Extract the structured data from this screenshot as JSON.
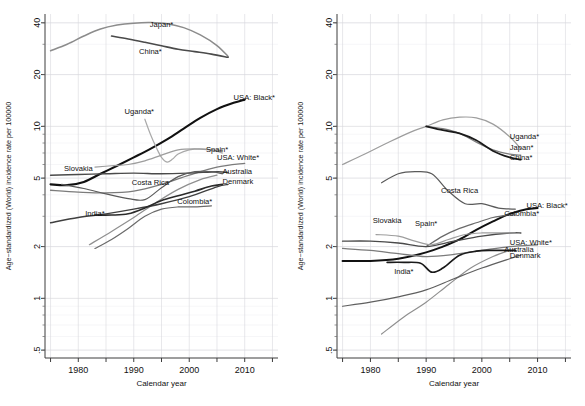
{
  "figure": {
    "title": "",
    "panel_count": 2
  },
  "axes": {
    "ylabel": "Age−standardized (World) incidence rate per 100000",
    "xlabel": "Calendar year",
    "yticks": [
      ".5",
      "1",
      "2",
      "5",
      "10",
      "20",
      "40"
    ],
    "ytick_values": [
      0.5,
      1,
      2,
      5,
      10,
      20,
      40
    ],
    "xticks": [
      "1980",
      "1990",
      "2000",
      "2010"
    ],
    "xtick_values": [
      1980,
      1990,
      2000,
      2010
    ],
    "xminor_values": [
      1975,
      1985,
      1995,
      2005,
      2015
    ],
    "xlim": [
      1974,
      2016
    ],
    "ylim": [
      0.45,
      45
    ],
    "yscale": "log",
    "grid": true
  },
  "colors": {
    "black": "#111111",
    "dark_gray": "#3f3f3f",
    "mid_gray": "#6e6e6e",
    "light_gray": "#a9a9a9",
    "pale_gray": "#c6c6c6",
    "grid": "#d9d9dd",
    "axis": "#3c3c3c"
  },
  "chart_data": [
    {
      "type": "line",
      "panel": "left",
      "title": "",
      "xlabel": "Calendar year",
      "ylabel": "Age−standardized (World) incidence rate per 100000",
      "yscale": "log",
      "xlim": [
        1974,
        2016
      ],
      "ylim": [
        0.45,
        45
      ],
      "grid": true,
      "legend": "inline-labels",
      "series": [
        {
          "name": "Japan*",
          "color": "#8c8c8c",
          "width": 1.5,
          "label_x": 1995,
          "label_y": 38.0,
          "x": [
            1975,
            1978,
            1981,
            1984,
            1987,
            1990,
            1993,
            1996,
            1999,
            2002,
            2005,
            2007
          ],
          "y": [
            27.5,
            30.0,
            33.5,
            36.8,
            38.8,
            39.8,
            40.1,
            39.5,
            37.5,
            34.0,
            29.5,
            25.5
          ]
        },
        {
          "name": "China*",
          "color": "#4a4a4a",
          "width": 1.6,
          "label_x": 1993,
          "label_y": 26.5,
          "x": [
            1986,
            1989,
            1992,
            1995,
            1998,
            2001,
            2004,
            2007
          ],
          "y": [
            33.5,
            32.2,
            30.8,
            29.4,
            28.1,
            27.2,
            26.3,
            25.2
          ]
        },
        {
          "name": "USA: Black*",
          "color": "#111111",
          "width": 2.1,
          "label_x": 2008,
          "label_y": 14.2,
          "x": [
            1975,
            1978,
            1981,
            1984,
            1987,
            1990,
            1993,
            1996,
            1999,
            2002,
            2005,
            2008,
            2010
          ],
          "y": [
            4.6,
            4.55,
            4.75,
            5.3,
            5.9,
            6.6,
            7.4,
            8.4,
            9.7,
            11.2,
            12.6,
            13.7,
            14.3
          ]
        },
        {
          "name": "Uganda*",
          "color": "#a9a9a9",
          "width": 1.2,
          "label_x": 1991,
          "label_y": 11.8,
          "x": [
            1992,
            1993,
            1994,
            1995,
            1996,
            1997,
            1998,
            2000,
            2002,
            2004,
            2006
          ],
          "y": [
            11.0,
            9.0,
            7.6,
            6.6,
            6.2,
            6.45,
            6.9,
            7.3,
            7.4,
            7.3,
            7.0
          ]
        },
        {
          "name": "Spain*",
          "color": "#9d9d9d",
          "width": 1.2,
          "label_x": 2003,
          "label_y": 7.1,
          "x": [
            1983,
            1986,
            1989,
            1992,
            1995,
            1998,
            2001,
            2004,
            2006
          ],
          "y": [
            5.8,
            5.9,
            6.0,
            6.3,
            6.8,
            7.3,
            7.4,
            7.3,
            7.2
          ]
        },
        {
          "name": "USA: White*",
          "color": "#7b7b7b",
          "width": 1.3,
          "label_x": 2005,
          "label_y": 6.4,
          "x": [
            1975,
            1980,
            1985,
            1990,
            1995,
            2000,
            2005,
            2010
          ],
          "y": [
            4.25,
            4.15,
            4.1,
            4.2,
            4.6,
            5.2,
            5.8,
            6.1
          ]
        },
        {
          "name": "Slovakia",
          "color": "#4a4a4a",
          "width": 1.4,
          "label_x": 1980,
          "label_y": 5.5,
          "x": [
            1975,
            1980,
            1985,
            1990,
            1995,
            2000,
            2005,
            2007
          ],
          "y": [
            5.2,
            5.25,
            5.3,
            5.35,
            5.3,
            5.35,
            5.45,
            5.4
          ]
        },
        {
          "name": "Costa Rica",
          "color": "#5a5a5a",
          "width": 1.2,
          "label_x": 1993,
          "label_y": 4.55,
          "x": [
            1977,
            1981,
            1985,
            1989,
            1992,
            1995,
            1998,
            2001,
            2004,
            2006
          ],
          "y": [
            4.6,
            4.35,
            4.05,
            3.8,
            3.75,
            4.4,
            5.1,
            5.45,
            5.45,
            5.3
          ]
        },
        {
          "name": "Australia",
          "color": "#8f8f8f",
          "width": 1.2,
          "label_x": 2006,
          "label_y": 5.3,
          "x": [
            1982,
            1986,
            1990,
            1994,
            1998,
            2002,
            2005
          ],
          "y": [
            2.05,
            2.45,
            2.95,
            3.6,
            4.3,
            4.9,
            5.2
          ]
        },
        {
          "name": "Denmark",
          "color": "#3f3f3f",
          "width": 1.4,
          "label_x": 2006,
          "label_y": 4.6,
          "x": [
            1975,
            1980,
            1985,
            1990,
            1995,
            2000,
            2005,
            2007
          ],
          "y": [
            2.75,
            2.95,
            3.1,
            3.3,
            3.55,
            3.9,
            4.45,
            4.6
          ]
        },
        {
          "name": "Colombia*",
          "color": "#6a6a6a",
          "width": 1.2,
          "label_x": 2001,
          "label_y": 3.55,
          "x": [
            1983,
            1986,
            1989,
            1992,
            1995,
            1998,
            2001,
            2004
          ],
          "y": [
            1.95,
            2.2,
            2.55,
            3.0,
            3.3,
            3.4,
            3.4,
            3.45
          ]
        },
        {
          "name": "India*",
          "color": "#2a2a2a",
          "width": 1.6,
          "label_x": 1983,
          "label_y": 3.0,
          "x": [
            1983,
            1986,
            1989,
            1992,
            1995,
            1998,
            2001,
            2004,
            2006
          ],
          "y": [
            3.05,
            3.05,
            3.1,
            3.35,
            3.7,
            3.95,
            4.2,
            4.5,
            4.6
          ]
        }
      ]
    },
    {
      "type": "line",
      "panel": "right",
      "title": "",
      "xlabel": "Calendar year",
      "ylabel": "Age−standardized (World) incidence rate per 100000",
      "yscale": "log",
      "xlim": [
        1974,
        2016
      ],
      "ylim": [
        0.45,
        45
      ],
      "grid": true,
      "legend": "inline-labels",
      "series": [
        {
          "name": "Uganda*",
          "color": "#9d9d9d",
          "width": 1.2,
          "label_x": 2005,
          "label_y": 8.4,
          "x": [
            1975,
            1979,
            1983,
            1987,
            1990,
            1993,
            1996,
            1999,
            2002,
            2005,
            2007
          ],
          "y": [
            6.0,
            6.9,
            8.0,
            9.2,
            10.0,
            10.9,
            11.3,
            11.2,
            10.3,
            8.7,
            7.4
          ]
        },
        {
          "name": "Japan*",
          "color": "#7d7d7d",
          "width": 1.2,
          "label_x": 2005,
          "label_y": 7.3,
          "x": [
            1990,
            1993,
            1996,
            1999,
            2002,
            2005,
            2007
          ],
          "y": [
            10.0,
            9.7,
            9.1,
            8.1,
            7.3,
            6.9,
            6.8
          ]
        },
        {
          "name": "China*",
          "color": "#1a1a1a",
          "width": 1.7,
          "label_x": 2005,
          "label_y": 6.4,
          "x": [
            1990,
            1993,
            1996,
            1999,
            2002,
            2005,
            2007
          ],
          "y": [
            10.0,
            9.5,
            9.1,
            8.3,
            7.2,
            6.6,
            6.4
          ]
        },
        {
          "name": "Costa Rica",
          "color": "#5a5a5a",
          "width": 1.2,
          "label_x": 1996,
          "label_y": 4.1,
          "x": [
            1982,
            1985,
            1988,
            1991,
            1994,
            1997,
            2000,
            2003,
            2006
          ],
          "y": [
            4.7,
            5.3,
            5.45,
            5.3,
            4.2,
            3.55,
            3.55,
            3.35,
            3.3
          ]
        },
        {
          "name": "USA: Black*",
          "color": "#111111",
          "width": 2.0,
          "label_x": 2008,
          "label_y": 3.35,
          "x": [
            1975,
            1980,
            1985,
            1990,
            1993,
            1996,
            1999,
            2002,
            2005,
            2008,
            2010
          ],
          "y": [
            1.65,
            1.65,
            1.7,
            1.85,
            2.0,
            2.2,
            2.5,
            2.8,
            3.1,
            3.3,
            3.35
          ]
        },
        {
          "name": "Colombia*",
          "color": "#6a6a6a",
          "width": 1.2,
          "label_x": 2004,
          "label_y": 3.0,
          "x": [
            1990,
            1993,
            1996,
            1999,
            2002,
            2005,
            2006
          ],
          "y": [
            2.0,
            2.3,
            2.55,
            2.75,
            2.95,
            3.05,
            3.05
          ]
        },
        {
          "name": "Slovakia",
          "color": "#4a4a4a",
          "width": 1.4,
          "label_x": 1983,
          "label_y": 2.75,
          "x": [
            1975,
            1980,
            1985,
            1990,
            1995,
            2000,
            2005,
            2007
          ],
          "y": [
            2.15,
            2.15,
            2.1,
            2.0,
            2.15,
            2.3,
            2.4,
            2.4
          ]
        },
        {
          "name": "Spain*",
          "color": "#9d9d9d",
          "width": 1.2,
          "label_x": 1990,
          "label_y": 2.65,
          "x": [
            1981,
            1985,
            1988,
            1991,
            1994,
            1997,
            2000,
            2003,
            2006
          ],
          "y": [
            2.35,
            2.3,
            2.15,
            2.05,
            2.2,
            2.35,
            2.4,
            2.4,
            2.4
          ]
        },
        {
          "name": "USA: White*",
          "color": "#7b7b7b",
          "width": 1.3,
          "label_x": 2005,
          "label_y": 2.05,
          "x": [
            1975,
            1980,
            1985,
            1990,
            1995,
            2000,
            2005,
            2010
          ],
          "y": [
            1.95,
            1.9,
            1.82,
            1.75,
            1.8,
            1.9,
            2.0,
            2.05
          ]
        },
        {
          "name": "Australia",
          "color": "#8f8f8f",
          "width": 1.2,
          "label_x": 2004,
          "label_y": 1.85,
          "x": [
            1982,
            1986,
            1990,
            1994,
            1998,
            2002,
            2005
          ],
          "y": [
            0.62,
            0.78,
            0.95,
            1.2,
            1.5,
            1.75,
            1.9
          ]
        },
        {
          "name": "Denmark",
          "color": "#5f5f5f",
          "width": 1.2,
          "label_x": 2005,
          "label_y": 1.72,
          "x": [
            1975,
            1980,
            1985,
            1990,
            1995,
            2000,
            2005,
            2007
          ],
          "y": [
            0.9,
            0.95,
            1.02,
            1.12,
            1.3,
            1.5,
            1.7,
            1.78
          ]
        },
        {
          "name": "India*",
          "color": "#1a1a1a",
          "width": 1.7,
          "label_x": 1986,
          "label_y": 1.38,
          "x": [
            1983,
            1986,
            1989,
            1991,
            1993,
            1996,
            1999,
            2002,
            2005,
            2006
          ],
          "y": [
            1.62,
            1.62,
            1.6,
            1.42,
            1.5,
            1.78,
            1.88,
            1.9,
            1.9,
            1.9
          ]
        }
      ]
    }
  ]
}
